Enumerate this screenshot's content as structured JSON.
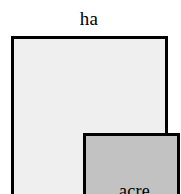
{
  "figure": {
    "type": "area-comparison-diagram",
    "caption": "ha",
    "background_color": "#ffffff",
    "outer_region": {
      "label": "ha",
      "label_position": "above",
      "fill_color": "#efefef",
      "border_color": "#000000",
      "border_width_px": 3
    },
    "inner_region": {
      "label": "acre",
      "label_position": "inside",
      "fill_color": "#c2c2c2",
      "border_color": "#000000",
      "border_width_px": 3
    }
  }
}
